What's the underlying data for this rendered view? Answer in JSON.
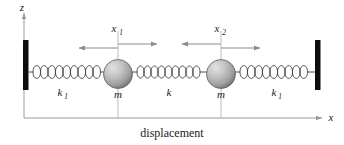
{
  "figure": {
    "caption": "displacement",
    "axes": {
      "vertical_label": "z",
      "horizontal_label": "x"
    },
    "springs": [
      {
        "id": "left-spring",
        "label": "k",
        "subscript": "1",
        "coils": 10
      },
      {
        "id": "middle-spring",
        "label": "k",
        "subscript": "",
        "coils": 9
      },
      {
        "id": "right-spring",
        "label": "k",
        "subscript": "1",
        "coils": 10
      }
    ],
    "masses": [
      {
        "id": "mass-left",
        "label": "m",
        "displacement_label": "x",
        "displacement_subscript": "1"
      },
      {
        "id": "mass-right",
        "label": "m",
        "displacement_label": "x",
        "displacement_subscript": "2"
      }
    ],
    "walls": [
      {
        "id": "wall-left"
      },
      {
        "id": "wall-right"
      }
    ],
    "colors": {
      "wall": "#0d0d0d",
      "spring": "#3b3b3b",
      "axis": "#9a9a9a",
      "guide": "#bdbdbd",
      "arrow": "#8c8c8c",
      "mass_light": "#d8d8d8",
      "mass_dark": "#7d7d7d",
      "text": "#1a1a1a",
      "background": "#ffffff"
    }
  }
}
